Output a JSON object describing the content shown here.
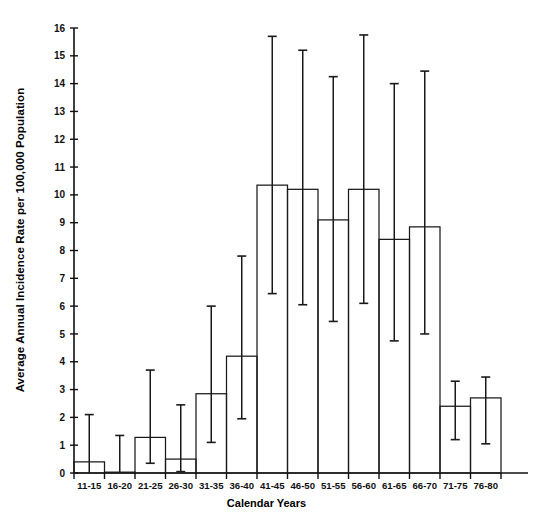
{
  "chart_data": {
    "type": "bar",
    "title": "",
    "xlabel": "Calendar Years",
    "ylabel": "Average Annual Incidence Rate per 100,000 Population",
    "ylim": [
      0,
      16
    ],
    "ytick_step": 1,
    "yticks": [
      "0",
      "1",
      "2",
      "3",
      "4",
      "5",
      "6",
      "7",
      "8",
      "9",
      "10",
      "11",
      "12",
      "13",
      "14",
      "15",
      "16"
    ],
    "grid": false,
    "legend": "none",
    "error_bars": "vertical capped whiskers (95% confidence interval)",
    "bar_style": "unfilled outline (histogram-style, adjacent bars)",
    "categories": [
      "11-15",
      "16-20",
      "21-25",
      "26-30",
      "31-35",
      "36-40",
      "41-45",
      "46-50",
      "51-55",
      "56-60",
      "61-65",
      "66-70",
      "71-75",
      "76-80"
    ],
    "values": [
      0.4,
      0.03,
      1.28,
      0.5,
      2.85,
      4.2,
      10.35,
      10.2,
      9.1,
      10.2,
      8.4,
      8.85,
      2.4,
      2.7
    ],
    "err_low": [
      0.0,
      0.0,
      0.35,
      0.05,
      1.1,
      1.95,
      6.45,
      6.05,
      5.45,
      6.1,
      4.75,
      5.0,
      1.2,
      1.05
    ],
    "err_high": [
      2.1,
      1.35,
      3.7,
      2.45,
      6.0,
      7.8,
      15.7,
      15.2,
      14.25,
      15.75,
      14.0,
      14.45,
      3.3,
      3.45
    ]
  },
  "axis": {
    "y_title": "Average Annual Incidence Rate per 100,000 Population",
    "x_title": "Calendar Years"
  }
}
